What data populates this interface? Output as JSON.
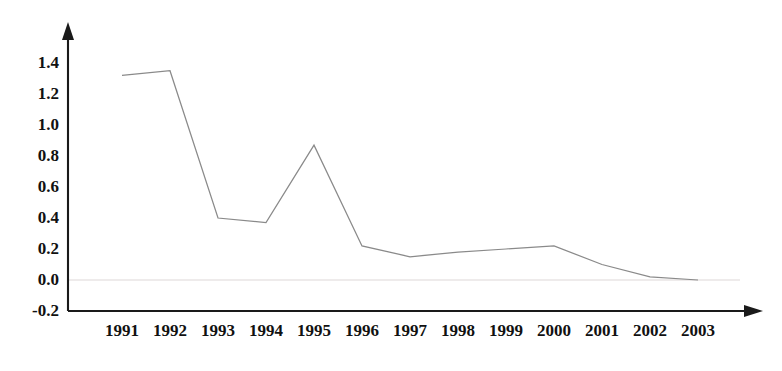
{
  "chart_data": {
    "type": "line",
    "title": "",
    "subtitle": "",
    "xlabel": "",
    "ylabel": "",
    "categories": [
      "1991",
      "1992",
      "1993",
      "1994",
      "1995",
      "1996",
      "1997",
      "1998",
      "1999",
      "2000",
      "2001",
      "2002",
      "2003"
    ],
    "x": [
      1991,
      1992,
      1993,
      1994,
      1995,
      1996,
      1997,
      1998,
      1999,
      2000,
      2001,
      2002,
      2003
    ],
    "values": [
      1.32,
      1.35,
      0.4,
      0.37,
      0.87,
      0.22,
      0.15,
      0.18,
      0.2,
      0.22,
      0.1,
      0.02,
      0.0
    ],
    "series": [
      {
        "name": "series-1",
        "values": [
          1.32,
          1.35,
          0.4,
          0.37,
          0.87,
          0.22,
          0.15,
          0.18,
          0.2,
          0.22,
          0.1,
          0.02,
          0.0
        ]
      }
    ],
    "ylim": [
      -0.2,
      1.4
    ],
    "xlim": [
      "1991",
      "2003"
    ],
    "ytick_labels": [
      "1.4",
      "1.2",
      "1.0",
      "0.8",
      "0.6",
      "0.4",
      "0.2",
      "0.0",
      "-0.2"
    ],
    "ytick_values": [
      1.4,
      1.2,
      1.0,
      0.8,
      0.6,
      0.4,
      0.2,
      0.0,
      -0.2
    ],
    "xtick_labels": [
      "1991",
      "1992",
      "1993",
      "1994",
      "1995",
      "1996",
      "1997",
      "1998",
      "1999",
      "2000",
      "2001",
      "2002",
      "2003"
    ],
    "grid": "zero-line-only",
    "legend": "none",
    "legend_position": "none",
    "line_color": "#8a8a8a",
    "axis_color": "#1a1a1a",
    "zero_line_color": "#e8e4e4",
    "background_color": "#ffffff",
    "axis_arrows": {
      "y_axis_arrow": "up-arrow",
      "x_axis_arrow": "right-arrow"
    },
    "annotations": []
  }
}
